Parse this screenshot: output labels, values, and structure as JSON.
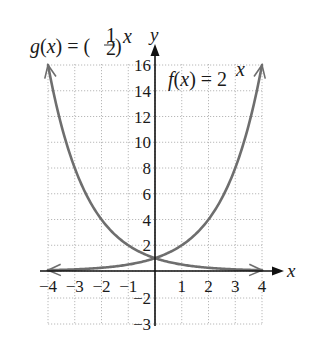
{
  "chart_data": {
    "type": "line",
    "title": "",
    "xlabel": "x",
    "ylabel": "y",
    "xlim": [
      -4,
      4
    ],
    "ylim": [
      -3,
      16
    ],
    "grid": true,
    "x_tick_labels": [
      "-4",
      "-3",
      "-2",
      "-1",
      "1",
      "2",
      "3",
      "4"
    ],
    "y_tick_labels": [
      "16",
      "14",
      "12",
      "10",
      "8",
      "6",
      "4",
      "2",
      "-2",
      "-3"
    ],
    "series": [
      {
        "name": "f(x) = 2^x",
        "label_base": "f(x) = 2",
        "label_exp": "x",
        "x": [
          -4,
          -3,
          -2,
          -1,
          0,
          1,
          2,
          3,
          4
        ],
        "values": [
          0.0625,
          0.125,
          0.25,
          0.5,
          1,
          2,
          4,
          8,
          16
        ]
      },
      {
        "name": "g(x) = (1/2)^x",
        "label_base": "g(x) = (",
        "label_frac_num": "1",
        "label_frac_den": "2",
        "label_close": ")",
        "label_exp": "x",
        "x": [
          -4,
          -3,
          -2,
          -1,
          0,
          1,
          2,
          3,
          4
        ],
        "values": [
          16,
          8,
          4,
          2,
          1,
          0.5,
          0.25,
          0.125,
          0.0625
        ]
      }
    ],
    "colors": {
      "curve": "#6e6e6e",
      "axis": "#111111",
      "grid": "#b8b8b8",
      "text": "#1a1a1a"
    }
  }
}
